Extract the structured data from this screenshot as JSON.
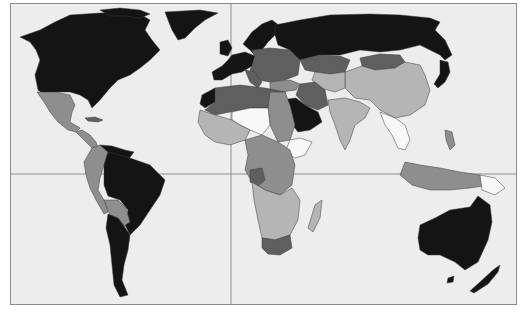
{
  "map": {
    "type": "choropleth world map",
    "projection": "equirectangular (cropped)",
    "frame": {
      "left": 10,
      "top": 3,
      "right": 517,
      "bottom": 305
    },
    "grid": {
      "prime_meridian_x": 231,
      "equator_y": 174
    },
    "palette": {
      "ocean": "#ededed",
      "class_5_black": "#141414",
      "class_4_dark": "#5f5f5f",
      "class_3_medium": "#8e8e8e",
      "class_2_light": "#b5b5b5",
      "class_1_white": "#f8f8f8",
      "border": "#3a3a3a"
    },
    "regions": [
      {
        "name": "North America (USA/Canada)",
        "class": "class_5_black"
      },
      {
        "name": "Greenland",
        "class": "class_5_black"
      },
      {
        "name": "Mexico",
        "class": "class_3_medium"
      },
      {
        "name": "Central America",
        "class": "class_3_medium"
      },
      {
        "name": "Cuba / Caribbean",
        "class": "class_4_dark"
      },
      {
        "name": "Venezuela",
        "class": "class_5_black"
      },
      {
        "name": "Colombia / Ecuador / Peru",
        "class": "class_3_medium"
      },
      {
        "name": "Brazil",
        "class": "class_5_black"
      },
      {
        "name": "Bolivia / Paraguay",
        "class": "class_3_medium"
      },
      {
        "name": "Argentina / Chile",
        "class": "class_5_black"
      },
      {
        "name": "Western Europe",
        "class": "class_5_black"
      },
      {
        "name": "Scandinavia",
        "class": "class_5_black"
      },
      {
        "name": "Eastern Europe",
        "class": "class_4_dark"
      },
      {
        "name": "Russia",
        "class": "class_5_black"
      },
      {
        "name": "Kazakhstan",
        "class": "class_4_dark"
      },
      {
        "name": "Mongolia",
        "class": "class_4_dark"
      },
      {
        "name": "China",
        "class": "class_2_light"
      },
      {
        "name": "Middle East (Iran/Turkey)",
        "class": "class_4_dark"
      },
      {
        "name": "Saudi Arabia",
        "class": "class_5_black"
      },
      {
        "name": "India",
        "class": "class_2_light"
      },
      {
        "name": "Southeast Asia",
        "class": "class_1_white"
      },
      {
        "name": "Indonesia / Philippines",
        "class": "class_3_medium"
      },
      {
        "name": "Japan",
        "class": "class_5_black"
      },
      {
        "name": "North Africa",
        "class": "class_4_dark"
      },
      {
        "name": "Morocco/W. Sahara",
        "class": "class_5_black"
      },
      {
        "name": "Sahel (Mali/Niger/Chad)",
        "class": "class_1_white"
      },
      {
        "name": "West Africa",
        "class": "class_2_light"
      },
      {
        "name": "East Africa (Ethiopia)",
        "class": "class_1_white"
      },
      {
        "name": "Central Africa",
        "class": "class_3_medium"
      },
      {
        "name": "Gabon/Congo",
        "class": "class_4_dark"
      },
      {
        "name": "Southern Africa",
        "class": "class_2_light"
      },
      {
        "name": "South Africa",
        "class": "class_4_dark"
      },
      {
        "name": "Madagascar",
        "class": "class_2_light"
      },
      {
        "name": "Australia",
        "class": "class_5_black"
      },
      {
        "name": "New Zealand",
        "class": "class_5_black"
      }
    ]
  }
}
